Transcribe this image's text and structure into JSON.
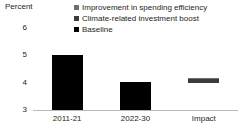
{
  "chart_data": {
    "type": "bar",
    "title": "",
    "subtitle": "",
    "xlabel": "",
    "ylabel": "Percent",
    "ylim": [
      3,
      6
    ],
    "yticks": [
      "3",
      "4",
      "5",
      "6"
    ],
    "ytick_values": [
      3,
      4,
      5,
      6
    ],
    "grid": false,
    "legend_position": "top-right",
    "categories": [
      "2011-21",
      "2022-30",
      "Impact"
    ],
    "series": [
      {
        "name": "Improvement in spending efficiency",
        "color": "#6f6f6f",
        "values": [
          0,
          0,
          0.04
        ]
      },
      {
        "name": "Climate-related investment boost",
        "color": "#3b3b3b",
        "values": [
          0,
          0,
          0.14
        ]
      },
      {
        "name": "Baseline",
        "color": "#000000",
        "values": [
          5.0,
          4.0,
          4.0
        ]
      }
    ],
    "bars": [
      {
        "category": "2011-21",
        "base": 3.0,
        "top": 5.0,
        "stacked": false,
        "segments": [
          {
            "series": "Baseline",
            "from": 3.0,
            "to": 5.0,
            "color": "#000000"
          }
        ]
      },
      {
        "category": "2022-30",
        "base": 3.0,
        "top": 4.02,
        "stacked": false,
        "segments": [
          {
            "series": "Baseline",
            "from": 3.0,
            "to": 4.02,
            "color": "#000000"
          }
        ]
      },
      {
        "category": "Impact",
        "base": 4.0,
        "top": 4.18,
        "stacked": true,
        "segments": [
          {
            "series": "Climate-related investment boost",
            "from": 4.0,
            "to": 4.14,
            "color": "#3b3b3b"
          },
          {
            "series": "Improvement in spending efficiency",
            "from": 4.14,
            "to": 4.18,
            "color": "#6f6f6f"
          }
        ]
      }
    ]
  },
  "legend": {
    "items": [
      {
        "label": "Improvement in spending efficiency",
        "color": "#6f6f6f"
      },
      {
        "label": "Climate-related investment boost",
        "color": "#3b3b3b"
      },
      {
        "label": "Baseline",
        "color": "#000000"
      }
    ]
  },
  "axis": {
    "unit_label": "Percent"
  }
}
